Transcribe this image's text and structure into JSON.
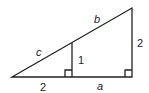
{
  "diagram": {
    "type": "similar right triangles",
    "labels": {
      "hyp_left": "c",
      "hyp_right": "b",
      "inner_height": "1",
      "outer_height": "2",
      "base_left": "2",
      "base_right": "a"
    },
    "colors": {
      "line": "#222222",
      "background": "#ffffff"
    }
  }
}
